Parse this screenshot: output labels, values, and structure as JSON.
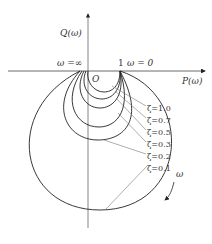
{
  "figure": {
    "axes": {
      "y_label": "Q(ω)",
      "x_label": "P(ω)",
      "origin_label": "O",
      "point_one_label": "1",
      "omega_zero_label": "ω = 0",
      "omega_inf_label": "ω =∞",
      "direction_label": "ω"
    },
    "curves": [
      {
        "zeta": "ζ=1.0"
      },
      {
        "zeta": "ζ=0.7"
      },
      {
        "zeta": "ζ=0.5"
      },
      {
        "zeta": "ζ=0.3"
      },
      {
        "zeta": "ζ=0.2"
      },
      {
        "zeta": "ζ=0.1"
      }
    ],
    "colors": {
      "stroke": "#222222",
      "leader": "#666666"
    }
  }
}
